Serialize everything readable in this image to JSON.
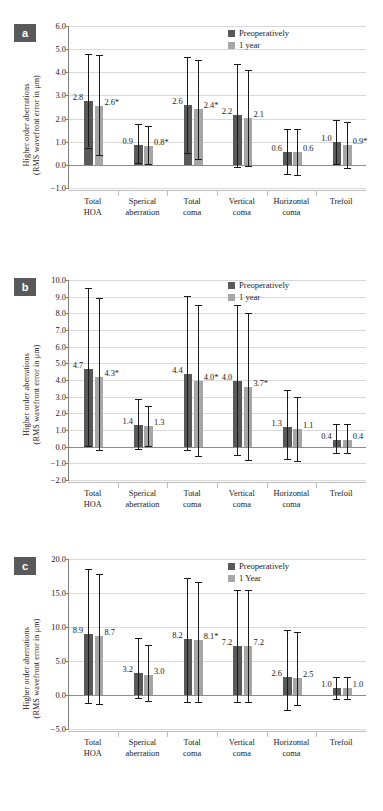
{
  "figure": {
    "axis_title_line1": "Higher order aberrations",
    "axis_title_line2": "(RMS wavefront error in μm)",
    "categories": [
      "Total\nHOA",
      "Sperical\naberration",
      "Total\ncoma",
      "Vertical\ncoma",
      "Horizontal\ncoma",
      "Trefoil"
    ],
    "colors": {
      "preop": "#595959",
      "oneyear": "#a6a6a6",
      "grid": "#d9d9d9",
      "axis": "#7f7f7f",
      "tag_bg": "#595959",
      "tag_fg": "#ffffff"
    }
  },
  "chart_data": [
    {
      "type": "bar",
      "panel": "a",
      "title": "",
      "xlabel": "",
      "ylabel": "Higher order aberrations (RMS wavefront error in μm)",
      "categories": [
        "Total HOA",
        "Sperical aberration",
        "Total coma",
        "Vertical coma",
        "Horizontal coma",
        "Trefoil"
      ],
      "category_labels": [
        [
          "Total",
          "HOA"
        ],
        [
          "Sperical",
          "aberration"
        ],
        [
          "Total",
          "coma"
        ],
        [
          "Vertical",
          "coma"
        ],
        [
          "Horizontal",
          "coma"
        ],
        [
          "Trefoil",
          ""
        ]
      ],
      "ylim": [
        -1.0,
        6.0
      ],
      "yticks": [
        "6.0",
        "5.0",
        "4.0",
        "3.0",
        "2.0",
        "1.0",
        "0.0",
        "−1.0"
      ],
      "ytick_values": [
        6.0,
        5.0,
        4.0,
        3.0,
        2.0,
        1.0,
        0.0,
        -1.0
      ],
      "grid": true,
      "legend_position": "top-right",
      "legend": [
        "Preoperatively",
        "1 year"
      ],
      "series": [
        {
          "name": "Preoperatively",
          "color": "#595959",
          "values": [
            2.78,
            0.87,
            2.58,
            2.15,
            0.57,
            0.97
          ],
          "labels": [
            "2.8",
            "0.9",
            "2.6",
            "2.2",
            "0.6",
            "1.0"
          ],
          "err_low": [
            0.75,
            0.1,
            0.52,
            -0.08,
            -0.38,
            0.03
          ],
          "err_high": [
            4.8,
            1.78,
            4.65,
            4.35,
            1.55,
            1.92
          ]
        },
        {
          "name": "1 year",
          "color": "#a6a6a6",
          "values": [
            2.56,
            0.8,
            2.4,
            2.03,
            0.55,
            0.86
          ],
          "labels": [
            "2.6*",
            "0.8*",
            "2.4*",
            "2.1",
            "0.6",
            "0.9*"
          ],
          "err_low": [
            0.44,
            0.02,
            0.26,
            -0.05,
            -0.45,
            -0.12
          ],
          "err_high": [
            4.74,
            1.68,
            4.55,
            4.1,
            1.55,
            1.85
          ]
        }
      ]
    },
    {
      "type": "bar",
      "panel": "b",
      "title": "",
      "xlabel": "",
      "ylabel": "Higher order aberrations (RMS wavefront error in μm)",
      "categories": [
        "Total HOA",
        "Sperical aberration",
        "Total coma",
        "Vertical coma",
        "Horizontal coma",
        "Trefoil"
      ],
      "category_labels": [
        [
          "Total",
          "HOA"
        ],
        [
          "Sperical",
          "aberration"
        ],
        [
          "Total",
          "coma"
        ],
        [
          "Vertical",
          "coma"
        ],
        [
          "Horizontal",
          "coma"
        ],
        [
          "Trefoil",
          ""
        ]
      ],
      "ylim": [
        -2.0,
        10.0
      ],
      "yticks": [
        "10.0",
        "9.0",
        "8.0",
        "7.0",
        "6.0",
        "5.0",
        "4.0",
        "3.0",
        "2.0",
        "1.0",
        "0.0",
        "−1.0",
        "−2.0"
      ],
      "ytick_values": [
        10.0,
        9.0,
        8.0,
        7.0,
        6.0,
        5.0,
        4.0,
        3.0,
        2.0,
        1.0,
        0.0,
        -1.0,
        -2.0
      ],
      "grid": true,
      "legend_position": "top-right",
      "legend": [
        "Preoperatively",
        "1 year"
      ],
      "series": [
        {
          "name": "Preoperatively",
          "color": "#595959",
          "values": [
            4.65,
            1.32,
            4.35,
            3.95,
            1.18,
            0.4
          ],
          "labels": [
            "4.7",
            "1.4",
            "4.4",
            "4.0",
            "1.3",
            "0.4"
          ],
          "err_low": [
            0.05,
            -0.12,
            -0.22,
            -0.48,
            -0.75,
            -0.38
          ],
          "err_high": [
            9.55,
            2.88,
            9.05,
            8.48,
            3.38,
            1.38
          ]
        },
        {
          "name": "1 year",
          "color": "#a6a6a6",
          "values": [
            4.2,
            1.22,
            3.95,
            3.58,
            1.07,
            0.42
          ],
          "labels": [
            "4.3*",
            "1.3",
            "4.0*",
            "3.7*",
            "1.1",
            "0.4"
          ],
          "err_low": [
            -0.22,
            0.06,
            -0.58,
            -0.8,
            -0.85,
            -0.4
          ],
          "err_high": [
            8.95,
            2.42,
            8.52,
            8.02,
            3.0,
            1.35
          ]
        }
      ]
    },
    {
      "type": "bar",
      "panel": "c",
      "title": "",
      "xlabel": "",
      "ylabel": "Higher order aberrations (RMS wavefront error in μm)",
      "categories": [
        "Total HOA",
        "Sperical aberration",
        "Total coma",
        "Vertical coma",
        "Horizontal coma",
        "Trefoil"
      ],
      "category_labels": [
        [
          "Total",
          "HOA"
        ],
        [
          "Sperical",
          "aberration"
        ],
        [
          "Total",
          "coma"
        ],
        [
          "Vertical",
          "coma"
        ],
        [
          "Horizontal",
          "coma"
        ],
        [
          "Trefoil",
          ""
        ]
      ],
      "ylim": [
        -5.0,
        20.0
      ],
      "yticks": [
        "20.0",
        "15.0",
        "10.0",
        "5.0",
        "0.0",
        "−5.0"
      ],
      "ytick_values": [
        20.0,
        15.0,
        10.0,
        5.0,
        0.0,
        -5.0
      ],
      "grid": true,
      "legend_position": "top-right",
      "legend": [
        "Preoperatively",
        "1 Year"
      ],
      "series": [
        {
          "name": "Preoperatively",
          "color": "#595959",
          "values": [
            8.9,
            3.2,
            8.2,
            7.2,
            2.6,
            1.0
          ],
          "labels": [
            "8.9",
            "3.2",
            "8.2",
            "7.2",
            "2.6",
            "1.0"
          ],
          "err_low": [
            -1.2,
            -0.4,
            -1.0,
            -1.0,
            -2.2,
            -0.6
          ],
          "err_high": [
            18.6,
            8.4,
            17.2,
            15.4,
            9.6,
            2.6
          ]
        },
        {
          "name": "1 Year",
          "color": "#a6a6a6",
          "values": [
            8.7,
            3.0,
            8.1,
            7.2,
            2.5,
            1.0
          ],
          "labels": [
            "8.7",
            "3.0",
            "8.1*",
            "7.2",
            "2.5",
            "1.0"
          ],
          "err_low": [
            -1.3,
            -0.9,
            -1.1,
            -1.0,
            -1.4,
            -0.6
          ],
          "err_high": [
            17.8,
            7.4,
            16.6,
            15.4,
            9.2,
            2.6
          ]
        }
      ]
    }
  ]
}
